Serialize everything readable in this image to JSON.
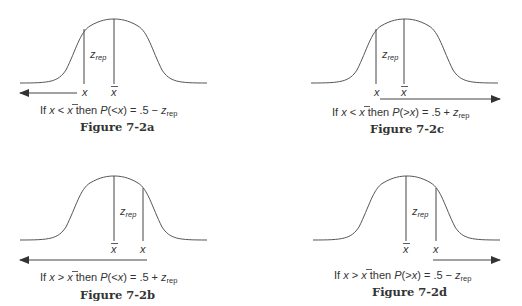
{
  "figures": [
    {
      "id": "7-2a",
      "title": "Figure 7-2a",
      "label_x": "x",
      "label_xbar": "x",
      "label_z": "z",
      "label_z_sub": "rep",
      "caption": {
        "prefix": "If ",
        "var1": "x",
        "op": " < ",
        "var2": "x",
        "mid": " then ",
        "p": "P",
        "paren": "(<",
        "pvar": "x",
        "close": ") = .5 − ",
        "z": "z",
        "zsub": "rep"
      },
      "arrow_direction": "left"
    },
    {
      "id": "7-2c",
      "title": "Figure 7-2c",
      "label_x": "x",
      "label_xbar": "x",
      "label_z": "z",
      "label_z_sub": "rep",
      "caption": {
        "prefix": "If ",
        "var1": "x",
        "op": " < ",
        "var2": "x",
        "mid": " then ",
        "p": "P",
        "paren": "(>",
        "pvar": "x",
        "close": ") = .5 + ",
        "z": "z",
        "zsub": "rep"
      },
      "arrow_direction": "right"
    },
    {
      "id": "7-2b",
      "title": "Figure 7-2b",
      "label_x": "x",
      "label_xbar": "x",
      "label_z": "z",
      "label_z_sub": "rep",
      "caption": {
        "prefix": "If ",
        "var1": "x",
        "op": " > ",
        "var2": "x",
        "mid": " then ",
        "p": "P",
        "paren": "(<",
        "pvar": "x",
        "close": ") = .5 + ",
        "z": "z",
        "zsub": "rep"
      },
      "arrow_direction": "left"
    },
    {
      "id": "7-2d",
      "title": "Figure 7-2d",
      "label_x": "x",
      "label_xbar": "x",
      "label_z": "z",
      "label_z_sub": "rep",
      "caption": {
        "prefix": "If ",
        "var1": "x",
        "op": " > ",
        "var2": "x",
        "mid": " then ",
        "p": "P",
        "paren": "(>",
        "pvar": "x",
        "close": ") = .5 − ",
        "z": "z",
        "zsub": "rep"
      },
      "arrow_direction": "right"
    }
  ]
}
